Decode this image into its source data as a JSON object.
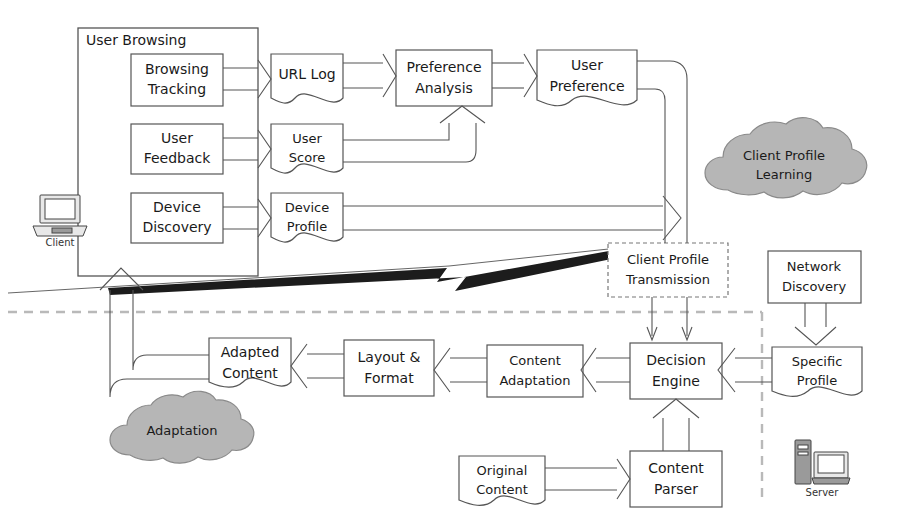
{
  "diagram": {
    "groups": [
      {
        "id": "user-browsing",
        "label": "User Browsing"
      }
    ],
    "clouds": [
      {
        "id": "client-profile-learning",
        "line1": "Client Profile",
        "line2": "Learning",
        "fill": "#b6b6b6"
      },
      {
        "id": "adaptation",
        "line1": "Adaptation",
        "line2": "",
        "fill": "#b6b6b6"
      }
    ],
    "nodes": [
      {
        "id": "browsing-tracking",
        "line1": "Browsing",
        "line2": "Tracking",
        "shape": "rect"
      },
      {
        "id": "user-feedback",
        "line1": "User",
        "line2": "Feedback",
        "shape": "rect"
      },
      {
        "id": "device-discovery",
        "line1": "Device",
        "line2": "Discovery",
        "shape": "rect"
      },
      {
        "id": "url-log",
        "line1": "URL Log",
        "line2": "",
        "shape": "document"
      },
      {
        "id": "user-score",
        "line1": "User",
        "line2": "Score",
        "shape": "document"
      },
      {
        "id": "device-profile",
        "line1": "Device",
        "line2": "Profile",
        "shape": "document"
      },
      {
        "id": "preference-analysis",
        "line1": "Preference",
        "line2": "Analysis",
        "shape": "rect"
      },
      {
        "id": "user-preference",
        "line1": "User",
        "line2": "Preference",
        "shape": "document"
      },
      {
        "id": "client-profile-transmission",
        "line1": "Client Profile",
        "line2": "Transmission",
        "shape": "rect-dashed"
      },
      {
        "id": "network-discovery",
        "line1": "Network",
        "line2": "Discovery",
        "shape": "rect"
      },
      {
        "id": "specific-profile",
        "line1": "Specific",
        "line2": "Profile",
        "shape": "document"
      },
      {
        "id": "decision-engine",
        "line1": "Decision",
        "line2": "Engine",
        "shape": "rect"
      },
      {
        "id": "content-adaptation",
        "line1": "Content",
        "line2": "Adaptation",
        "shape": "rect"
      },
      {
        "id": "layout-format",
        "line1": "Layout &",
        "line2": "Format",
        "shape": "rect"
      },
      {
        "id": "adapted-content",
        "line1": "Adapted",
        "line2": "Content",
        "shape": "document"
      },
      {
        "id": "original-content",
        "line1": "Original",
        "line2": "Content",
        "shape": "document"
      },
      {
        "id": "content-parser",
        "line1": "Content",
        "line2": "Parser",
        "shape": "rect"
      }
    ],
    "icons": [
      {
        "id": "client-icon",
        "label": "Client"
      },
      {
        "id": "server-icon",
        "label": "Server"
      }
    ],
    "separators": [
      {
        "id": "wireless-link",
        "kind": "lightning-bolt"
      },
      {
        "id": "horizontal-boundary",
        "kind": "dashed-line"
      },
      {
        "id": "vertical-boundary",
        "kind": "dashed-line"
      }
    ]
  }
}
